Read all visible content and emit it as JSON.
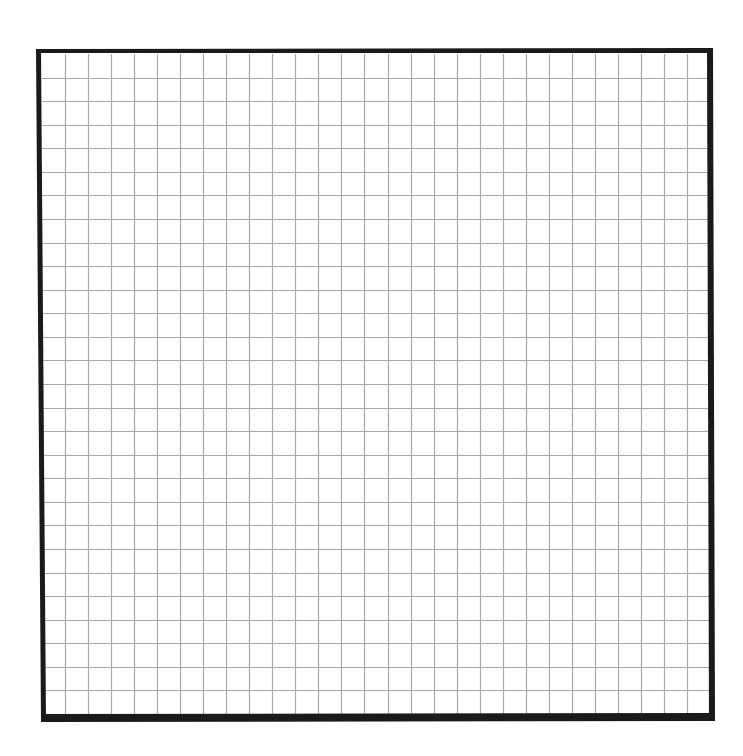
{
  "sheet": {
    "type": "graph-paper-grid",
    "columns": 29,
    "rows": 28,
    "colors": {
      "background": "#ffffff",
      "border": "#1a1a1a",
      "grid_line": "#a8a8a8"
    }
  }
}
